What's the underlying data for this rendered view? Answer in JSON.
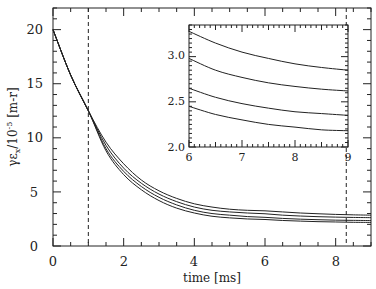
{
  "chart_data": [
    {
      "name": "main",
      "type": "line",
      "title": "",
      "xlabel": "time [ms]",
      "ylabel": "γε_x/10^-5 [m-r]",
      "xlim": [
        0,
        9
      ],
      "ylim": [
        0,
        22
      ],
      "xticks": [
        "0",
        "2",
        "4",
        "6",
        "8"
      ],
      "yticks": [
        "0",
        "5",
        "10",
        "15",
        "20"
      ],
      "grid": false,
      "legend": null,
      "vlines": [
        1.0,
        8.3
      ],
      "x": [
        0,
        0.5,
        1,
        1.5,
        2,
        2.5,
        3,
        3.5,
        4,
        4.5,
        5,
        5.5,
        6,
        6.5,
        7,
        7.5,
        8,
        8.5,
        9
      ],
      "series": [
        {
          "name": "curve 1",
          "values": [
            20,
            15.8,
            12.5,
            9.6,
            7.6,
            6.1,
            5.1,
            4.4,
            3.9,
            3.6,
            3.4,
            3.3,
            3.25,
            3.15,
            3.05,
            2.98,
            2.92,
            2.88,
            2.85
          ]
        },
        {
          "name": "curve 2",
          "values": [
            20,
            15.8,
            12.5,
            9.3,
            7.2,
            5.8,
            4.8,
            4.1,
            3.6,
            3.3,
            3.15,
            3.05,
            2.98,
            2.85,
            2.77,
            2.71,
            2.67,
            2.64,
            2.62
          ]
        },
        {
          "name": "curve 3",
          "values": [
            20,
            15.8,
            12.5,
            9.0,
            6.9,
            5.5,
            4.5,
            3.8,
            3.3,
            3.0,
            2.85,
            2.72,
            2.65,
            2.55,
            2.48,
            2.43,
            2.39,
            2.37,
            2.35
          ]
        },
        {
          "name": "curve 4",
          "values": [
            20,
            15.8,
            12.5,
            8.8,
            6.6,
            5.2,
            4.2,
            3.5,
            3.05,
            2.75,
            2.6,
            2.5,
            2.45,
            2.36,
            2.3,
            2.25,
            2.22,
            2.19,
            2.18
          ]
        }
      ]
    },
    {
      "name": "inset",
      "type": "line",
      "title": "",
      "xlabel": "",
      "ylabel": "",
      "xlim": [
        6,
        9
      ],
      "ylim": [
        2.0,
        3.35
      ],
      "xticks": [
        "6",
        "7",
        "8",
        "9"
      ],
      "yticks": [
        "2.0",
        "2.5",
        "3.0"
      ],
      "grid": false,
      "x": [
        6,
        6.5,
        7,
        7.5,
        8,
        8.5,
        9
      ],
      "series": [
        {
          "name": "curve 1",
          "values": [
            3.28,
            3.15,
            3.05,
            2.98,
            2.92,
            2.88,
            2.85
          ]
        },
        {
          "name": "curve 2",
          "values": [
            2.98,
            2.85,
            2.77,
            2.71,
            2.67,
            2.64,
            2.62
          ]
        },
        {
          "name": "curve 3",
          "values": [
            2.65,
            2.55,
            2.48,
            2.43,
            2.39,
            2.37,
            2.35
          ]
        },
        {
          "name": "curve 4",
          "values": [
            2.45,
            2.36,
            2.3,
            2.25,
            2.22,
            2.19,
            2.18
          ]
        }
      ]
    }
  ],
  "labels": {
    "xlabel": "time [ms]",
    "ylabel_main": "γε",
    "ylabel_sub": "x",
    "ylabel_rest": "/10",
    "ylabel_exp": "-5",
    "ylabel_unit": " [m-r]",
    "x_ticks": [
      "0",
      "2",
      "4",
      "6",
      "8"
    ],
    "y_ticks": [
      "0",
      "5",
      "10",
      "15",
      "20"
    ],
    "inset_x_ticks": [
      "6",
      "7",
      "8",
      "9"
    ],
    "inset_y_ticks": [
      "2.0",
      "2.5",
      "3.0"
    ]
  },
  "colors": {
    "line": "#222222",
    "frame": "#222222",
    "background": "#ffffff"
  }
}
